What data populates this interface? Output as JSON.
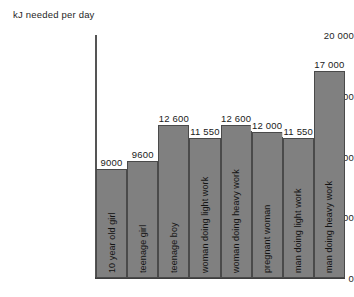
{
  "chart_data": {
    "type": "bar",
    "title": "",
    "ylabel": "kJ needed per day",
    "xlabel": "",
    "ylim": [
      0,
      20000
    ],
    "yticks": [
      0,
      5000,
      10000,
      15000,
      20000
    ],
    "ytick_labels": [
      "0",
      "5000",
      "10 000",
      "15 000",
      "20 000"
    ],
    "grid": false,
    "legend": null,
    "categories": [
      "10 year old girl",
      "teenage girl",
      "teenage boy",
      "woman doing light work",
      "woman doing heavy work",
      "pregnant woman",
      "man doing light work",
      "man doing heavy work"
    ],
    "values": [
      9000,
      9600,
      12600,
      11550,
      12600,
      12000,
      11550,
      17000
    ],
    "value_labels": [
      "9000",
      "9600",
      "12 600",
      "11 550",
      "12 600",
      "12 000",
      "11 550",
      "17 000"
    ],
    "bar_color": "#808080",
    "bar_edge_color": "#4a4a4a",
    "axis_color": "#555555",
    "text_color": "#1a1a1a"
  }
}
